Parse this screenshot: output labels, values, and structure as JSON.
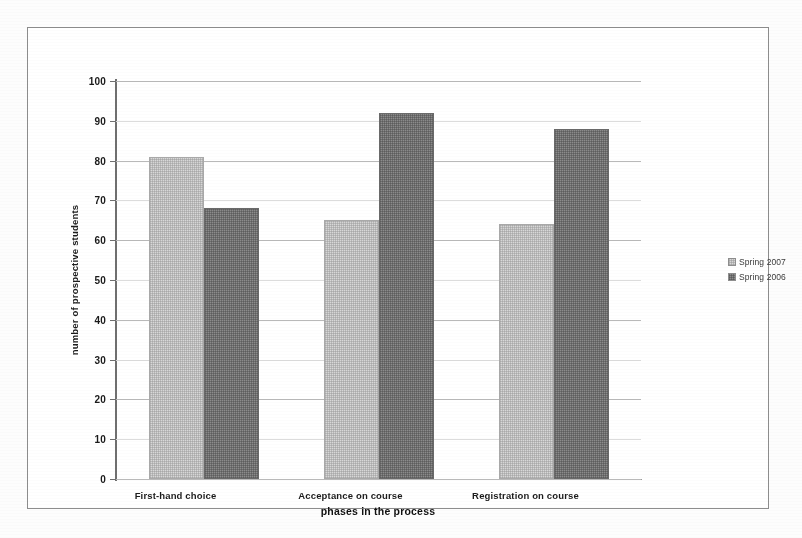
{
  "chart_data": {
    "type": "bar",
    "title": "",
    "xlabel": "phases in the process",
    "ylabel": "number of prospective students",
    "categories": [
      "First-hand choice",
      "Acceptance on course",
      "Registration on course"
    ],
    "series": [
      {
        "name": "Spring 2007",
        "values": [
          81,
          65,
          64
        ],
        "color": "#d8d8d8"
      },
      {
        "name": "Spring 2006",
        "values": [
          68,
          92,
          88
        ],
        "color": "#8c8c8c"
      }
    ],
    "ylim": [
      0,
      100
    ],
    "yticks": [
      0,
      10,
      20,
      30,
      40,
      50,
      60,
      70,
      80,
      90,
      100
    ],
    "grid": true,
    "legend_position": "right"
  },
  "legend": {
    "entries": [
      {
        "label": "Spring 2007",
        "swatch": "legend-swatch-series-0"
      },
      {
        "label": "Spring 2006",
        "swatch": "legend-swatch-series-1"
      }
    ]
  },
  "axes": {
    "y_title": "number of prospective students",
    "x_title": "phases in the process",
    "y_tick_labels": [
      "100",
      "90",
      "80",
      "70",
      "60",
      "50",
      "40",
      "30",
      "20",
      "10",
      "0"
    ]
  }
}
